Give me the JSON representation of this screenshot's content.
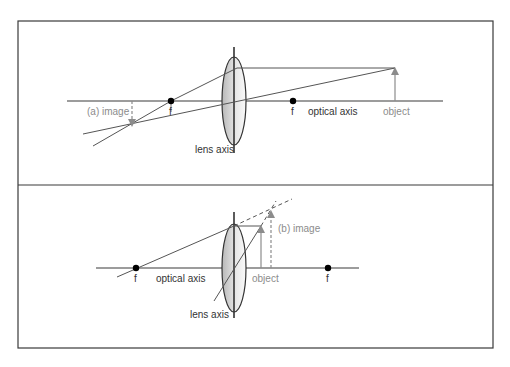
{
  "colors": {
    "line": "#4a4a4a",
    "border": "#3a3a3a",
    "object_image": "#8c8c8c",
    "lens_fill_dark": "#bdbdbd",
    "lens_fill_light": "#f5f5f5",
    "focal_dot": "#000000"
  },
  "panel_a": {
    "focal_left_label": "f",
    "focal_right_label": "f",
    "optical_axis_label": "optical axis",
    "lens_axis_label": "lens axis",
    "object_label": "object",
    "image_label": "(a) image"
  },
  "panel_b": {
    "focal_left_label": "f",
    "focal_right_label": "f",
    "optical_axis_label": "optical axis",
    "lens_axis_label": "lens axis",
    "object_label": "object",
    "image_label": "(b) image"
  }
}
